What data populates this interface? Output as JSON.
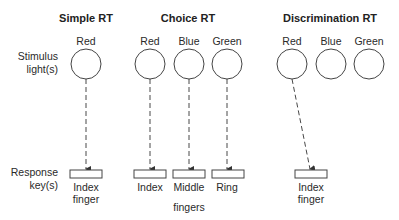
{
  "headings": {
    "simple": "Simple RT",
    "choice": "Choice RT",
    "discrimination": "Discrimination RT"
  },
  "row_labels": {
    "stimulus_line1": "Stimulus",
    "stimulus_line2": "light(s)",
    "response_line1": "Response",
    "response_line2": "key(s)"
  },
  "simple": {
    "lights": [
      "Red"
    ],
    "keys": [
      {
        "line1": "Index",
        "line2": "finger"
      }
    ]
  },
  "choice": {
    "lights": [
      "Red",
      "Blue",
      "Green"
    ],
    "keys": [
      "Index",
      "Middle",
      "Ring"
    ],
    "keys_caption": "fingers"
  },
  "discrimination": {
    "lights": [
      "Red",
      "Blue",
      "Green"
    ],
    "keys": [
      {
        "line1": "Index",
        "line2": "finger"
      }
    ]
  },
  "colors": {
    "stroke": "#333333",
    "text": "#222222"
  }
}
